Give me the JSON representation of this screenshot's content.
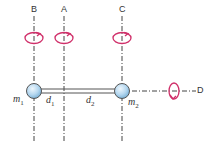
{
  "axes": {
    "B": {
      "label": "B",
      "x": 34
    },
    "A": {
      "label": "A",
      "x": 64
    },
    "C": {
      "label": "C",
      "x": 122
    },
    "D": {
      "label": "D",
      "y": 91
    }
  },
  "masses": {
    "m1": {
      "label": "m",
      "sub": "1"
    },
    "m2": {
      "label": "m",
      "sub": "2"
    }
  },
  "distances": {
    "d1": {
      "label": "d",
      "sub": "1"
    },
    "d2": {
      "label": "d",
      "sub": "2"
    }
  },
  "colors": {
    "axis": "#444444",
    "rotation": "#d0306a",
    "ball_fill": "#bcdcf2",
    "ball_stroke": "#555555",
    "rod": "#555555"
  }
}
